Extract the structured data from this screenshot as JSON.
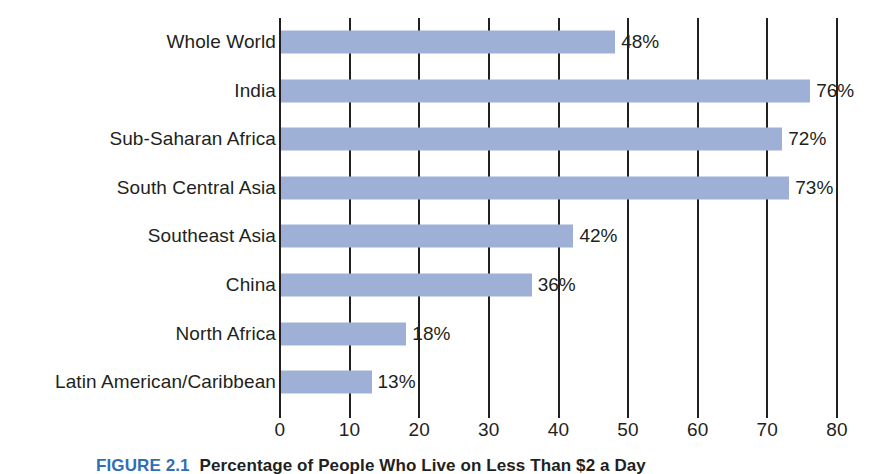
{
  "chart_data": {
    "type": "bar",
    "orientation": "horizontal",
    "title": "Percentage of People Who Live on Less Than $2 a Day",
    "figure_number": "FIGURE 2.1",
    "xlabel": "",
    "ylabel": "",
    "xlim": [
      0,
      80
    ],
    "grid": true,
    "legend": false,
    "xticks": [
      0,
      10,
      20,
      30,
      40,
      50,
      60,
      70,
      80
    ],
    "xticklabels": [
      "0",
      "10",
      "20",
      "30",
      "40",
      "50",
      "60",
      "70",
      "80"
    ],
    "categories": [
      "Whole World",
      "India",
      "Sub-Saharan Africa",
      "South Central Asia",
      "Southeast Asia",
      "China",
      "North Africa",
      "Latin American/Caribbean"
    ],
    "values": [
      48,
      76,
      72,
      73,
      42,
      36,
      18,
      13
    ],
    "value_labels": [
      "48%",
      "76%",
      "72%",
      "73%",
      "42%",
      "36%",
      "18%",
      "13%"
    ],
    "bar_color": "#9fb0d6",
    "axis_color": "#231f20",
    "accent_color": "#2f6fb5"
  },
  "caption": {
    "number": "FIGURE 2.1",
    "title": "Percentage of People Who Live on Less Than $2 a Day"
  }
}
